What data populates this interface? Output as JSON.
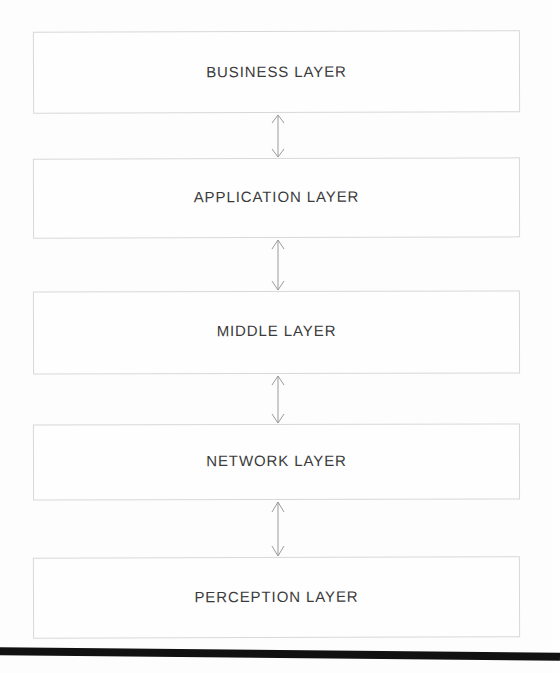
{
  "diagram": {
    "background_color": "#fdfdfd",
    "box_border_color": "#d8d8d8",
    "label_color": "#3b3b3b",
    "scan_bar_color": "#111111",
    "layers": [
      {
        "label": "BUSINESS LAYER"
      },
      {
        "label": "APPLICATION LAYER"
      },
      {
        "label": "MIDDLE LAYER"
      },
      {
        "label": "NETWORK LAYER"
      },
      {
        "label": "PERCEPTION LAYER"
      }
    ],
    "connectors": [
      {
        "icon": "double-headed-vertical-arrow",
        "from": "BUSINESS LAYER",
        "to": "APPLICATION LAYER"
      },
      {
        "icon": "double-headed-vertical-arrow",
        "from": "APPLICATION LAYER",
        "to": "MIDDLE LAYER"
      },
      {
        "icon": "double-headed-vertical-arrow",
        "from": "MIDDLE LAYER",
        "to": "NETWORK LAYER"
      },
      {
        "icon": "double-headed-vertical-arrow",
        "from": "NETWORK LAYER",
        "to": "PERCEPTION LAYER"
      }
    ]
  }
}
